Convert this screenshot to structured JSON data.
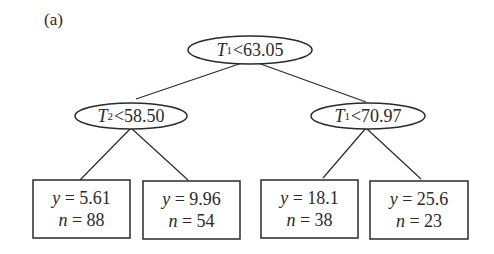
{
  "panel_label": "(a)",
  "tree": {
    "root": {
      "var": "T",
      "sub": "1",
      "op": "<",
      "threshold": "63.05"
    },
    "left": {
      "var": "T",
      "sub": "2",
      "op": "<",
      "threshold": "58.50"
    },
    "right": {
      "var": "T",
      "sub": "1",
      "op": "<",
      "threshold": "70.97"
    },
    "leaves": [
      {
        "y_label": "y",
        "y": "5.61",
        "n_label": "n",
        "n": "88"
      },
      {
        "y_label": "y",
        "y": "9.96",
        "n_label": "n",
        "n": "54"
      },
      {
        "y_label": "y",
        "y": "18.1",
        "n_label": "n",
        "n": "38"
      },
      {
        "y_label": "y",
        "y": "25.6",
        "n_label": "n",
        "n": "23"
      }
    ]
  },
  "colors": {
    "stroke": "#2a2a2a",
    "background": "#ffffff"
  }
}
